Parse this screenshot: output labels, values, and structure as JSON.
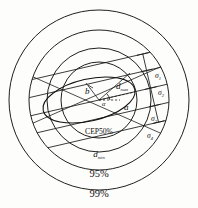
{
  "figure": {
    "background_color": "#fdfdfc",
    "ink_color": "#141414",
    "center": {
      "x": 99,
      "y": 100
    }
  },
  "circles": [
    {
      "name": "cep50",
      "label": "CEP50%",
      "radius": 38,
      "label_x": 99,
      "label_y": 133
    },
    {
      "name": "dmin",
      "label": "d",
      "sublabel": "min",
      "radius": 52,
      "label_x": 99,
      "label_y": 156
    },
    {
      "name": "p95",
      "label": "95%",
      "radius": 70,
      "label_x": 99,
      "label_y": 176
    },
    {
      "name": "p99",
      "label": "99%",
      "radius": 90,
      "label_x": 99,
      "label_y": 196
    }
  ],
  "ellipse": {
    "name": "error-ellipse",
    "semi_major": 47,
    "semi_minor": 21,
    "rotation_deg": -13,
    "center_x": 89,
    "center_y": 100
  },
  "axis_labels": {
    "semi_major": {
      "text": "a",
      "x": 127,
      "y": 107
    },
    "semi_minor": {
      "text": "b",
      "prime": "'",
      "x": 90,
      "y": 93
    },
    "angle": {
      "text": "α",
      "x": 96,
      "y": 105
    },
    "dmax": {
      "text": "d",
      "sublabel": "max",
      "x": 118,
      "y": 88
    }
  },
  "sigma_labels": [
    {
      "name": "sigma-1",
      "text": "σ",
      "sub": "1",
      "x": 155,
      "y": 76
    },
    {
      "name": "sigma-2",
      "text": "σ",
      "sub": "2",
      "x": 157,
      "y": 93
    },
    {
      "name": "sigma-3",
      "text": "σ",
      "sub": "3",
      "x": 151,
      "y": 119
    },
    {
      "name": "sigma-4",
      "text": "σ",
      "sub": "4",
      "x": 148,
      "y": 135
    }
  ],
  "diagonal_lines": {
    "name": "parallel-band-lines",
    "count": 5,
    "angle_deg": -13,
    "description": "five parallel chords crossing the circles"
  },
  "cross_lines": {
    "name": "cross-chords",
    "count": 2,
    "description": "two long chords crossing through the ellipse centre"
  }
}
